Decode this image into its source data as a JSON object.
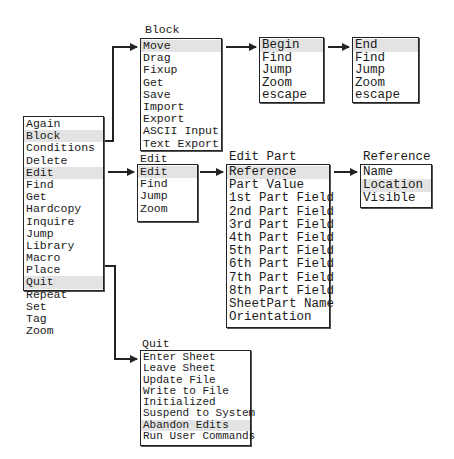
{
  "main_menu": {
    "items": [
      "Again",
      "Block",
      "Conditions",
      "Delete",
      "Edit",
      "Find",
      "Get",
      "Hardcopy",
      "Inquire",
      "Jump",
      "Library",
      "Macro",
      "Place",
      "Quit",
      "Repeat",
      "Set",
      "Tag",
      "Zoom"
    ],
    "highlighted": [
      "Block",
      "Edit",
      "Quit"
    ]
  },
  "block_menu": {
    "title": "Block",
    "items": [
      "Move",
      "Drag",
      "Fixup",
      "Get",
      "Save",
      "Import",
      "Export",
      "ASCII Input",
      "Text Export"
    ],
    "highlighted": [
      "Move"
    ]
  },
  "begin_menu": {
    "items": [
      "Begin",
      "Find",
      "Jump",
      "Zoom",
      "escape"
    ],
    "highlighted": [
      "Begin"
    ]
  },
  "end_menu": {
    "items": [
      "End",
      "Find",
      "Jump",
      "Zoom",
      "escape"
    ],
    "highlighted": [
      "End"
    ]
  },
  "edit_menu": {
    "title": "Edit",
    "items": [
      "Edit",
      "Find",
      "Jump",
      "Zoom"
    ],
    "highlighted": [
      "Edit"
    ]
  },
  "edit_part_menu": {
    "title": "Edit Part",
    "items": [
      "Reference",
      "Part Value",
      "1st Part Field",
      "2nd Part Field",
      "3rd Part Field",
      "4th Part Field",
      "5th Part Field",
      "6th Part Field",
      "7th Part Field",
      "8th Part Field",
      "SheetPart Name",
      "Orientation"
    ],
    "highlighted": [
      "Reference"
    ]
  },
  "reference_menu": {
    "title": "Reference",
    "items": [
      "Name",
      "Location",
      "Visible"
    ],
    "highlighted": [
      "Location"
    ]
  },
  "quit_menu": {
    "title": "Quit",
    "items": [
      "Enter Sheet",
      "Leave Sheet",
      "Update File",
      "Write to File",
      "Initialized",
      "Suspend to System",
      "Abandon Edits",
      "Run User Commands"
    ],
    "highlighted": [
      "Abandon Edits"
    ]
  },
  "colors": {
    "line": "#222222",
    "highlight": "#e3e3e3",
    "background": "#ffffff"
  }
}
